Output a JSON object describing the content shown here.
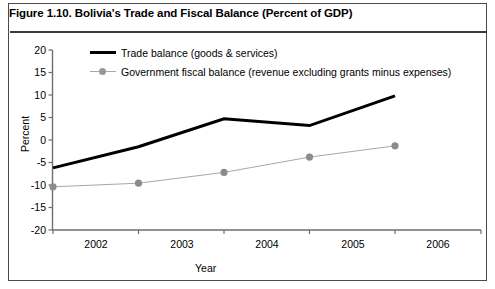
{
  "figure": {
    "title": "Figure 1.10. Bolivia's Trade and Fiscal Balance (Percent of GDP)"
  },
  "colors": {
    "trade_line": "#000000",
    "fiscal_line": "#a8a8a8",
    "fiscal_marker": "#8c8c8c",
    "axis": "#6e6e6e",
    "frame": "#4a4a4a",
    "background": "#ffffff"
  },
  "chart_data": {
    "type": "line",
    "title": "Figure 1.10. Bolivia's Trade and Fiscal Balance (Percent of GDP)",
    "xlabel": "Year",
    "ylabel": "Percent",
    "categories": [
      "2002",
      "2003",
      "2004",
      "2005",
      "2006"
    ],
    "x": [
      2002,
      2003,
      2004,
      2005,
      2006
    ],
    "ylim": [
      -20,
      20
    ],
    "yticks": [
      20,
      15,
      10,
      5,
      0,
      -5,
      -10,
      -15,
      -20
    ],
    "ytick_labels": [
      "20",
      "15",
      "10",
      "5",
      "0",
      "-5",
      "-10",
      "-15",
      "-20"
    ],
    "xtick_labels": [
      "2002",
      "2003",
      "2004",
      "2005",
      "2006"
    ],
    "grid": false,
    "legend_position": "top-left inside",
    "series": [
      {
        "name": "Trade balance (goods & services)",
        "values": [
          -6.2,
          -1.5,
          4.7,
          3.2,
          9.8
        ],
        "color": "#000000",
        "marker": "none",
        "line_width": 3
      },
      {
        "name": "Government fiscal balance (revenue excluding grants minus expenses)",
        "values": [
          -10.4,
          -9.6,
          -7.2,
          -3.8,
          -1.3
        ],
        "color": "#a8a8a8",
        "marker": "circle",
        "line_width": 1
      }
    ]
  }
}
